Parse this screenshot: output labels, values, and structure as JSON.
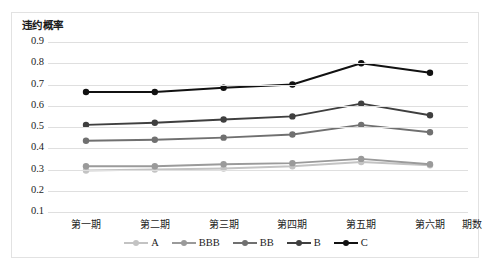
{
  "chart_data": {
    "type": "line",
    "title": "",
    "ylabel": "违约概率",
    "xlabel": "期数",
    "categories": [
      "第一期",
      "第二期",
      "第三期",
      "第四期",
      "第五期",
      "第六期"
    ],
    "ylim": [
      0.1,
      0.9
    ],
    "y_ticks": [
      "0.9",
      "0.8",
      "0.7",
      "0.6",
      "0.5",
      "0.4",
      "0.3",
      "0.2",
      "0.1"
    ],
    "y_tick_values": [
      0.9,
      0.8,
      0.7,
      0.6,
      0.5,
      0.4,
      0.3,
      0.2,
      0.1
    ],
    "grid": true,
    "legend_position": "bottom",
    "markers": true,
    "series": [
      {
        "name": "A",
        "color": "#c3c3c3",
        "values": [
          0.295,
          0.3,
          0.305,
          0.315,
          0.335,
          0.32
        ]
      },
      {
        "name": "BBB",
        "color": "#9a9a9a",
        "values": [
          0.315,
          0.315,
          0.325,
          0.33,
          0.35,
          0.325
        ]
      },
      {
        "name": "BB",
        "color": "#707070",
        "values": [
          0.435,
          0.44,
          0.45,
          0.465,
          0.51,
          0.475
        ]
      },
      {
        "name": "B",
        "color": "#3f3f3f",
        "values": [
          0.51,
          0.52,
          0.535,
          0.55,
          0.61,
          0.555
        ]
      },
      {
        "name": "C",
        "color": "#111111",
        "values": [
          0.665,
          0.665,
          0.685,
          0.7,
          0.8,
          0.755
        ]
      }
    ]
  },
  "legend": {
    "items": [
      {
        "label": "A"
      },
      {
        "label": "BBB"
      },
      {
        "label": "BB"
      },
      {
        "label": "B"
      },
      {
        "label": "C"
      }
    ]
  }
}
